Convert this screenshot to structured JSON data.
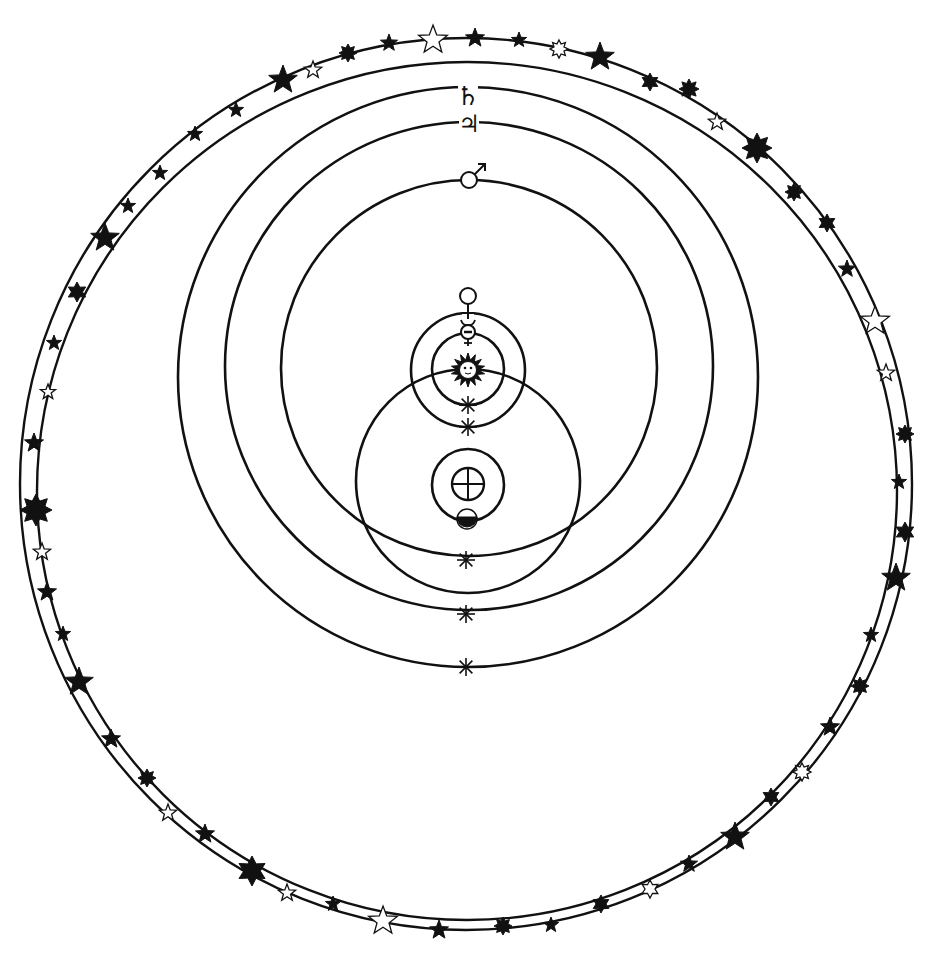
{
  "colors": {
    "ink": "#111111",
    "paper": "#ffffff"
  },
  "sphere_of_fixed_stars": {
    "label": "Sphere of fixed stars",
    "outer": {
      "cx": 466,
      "cy": 484,
      "rx": 446,
      "ry": 446
    },
    "inner": {
      "cx": 467,
      "cy": 491,
      "rx": 430,
      "ry": 429
    }
  },
  "orbits": [
    {
      "name": "saturn-orbit",
      "label": "Saturn",
      "symbol": "♄",
      "cx": 468,
      "cy": 377,
      "r": 290,
      "symbol_y": 96
    },
    {
      "name": "jupiter-orbit",
      "label": "Jupiter",
      "symbol": "♃",
      "cx": 469,
      "cy": 366,
      "r": 244,
      "symbol_y": 124
    },
    {
      "name": "mars-orbit",
      "label": "Mars",
      "symbol": "♂",
      "cx": 469,
      "cy": 368,
      "r": 188,
      "symbol_y": 180
    },
    {
      "name": "sun-orbit",
      "label": "Sun's orbit around Earth",
      "cx": 468,
      "cy": 481,
      "r": 112
    },
    {
      "name": "venus-orbit",
      "label": "Venus",
      "symbol": "♀",
      "cx": 468,
      "cy": 370,
      "r": 57
    },
    {
      "name": "mercury-orbit",
      "label": "Mercury",
      "symbol": "☿",
      "cx": 468,
      "cy": 369,
      "r": 36
    },
    {
      "name": "moon-orbit",
      "label": "Moon's orbit",
      "cx": 468,
      "cy": 485,
      "r": 36
    }
  ],
  "bodies": {
    "earth": {
      "label": "Earth",
      "symbol": "⊕",
      "cx": 468,
      "cy": 484,
      "r": 16
    },
    "moon": {
      "label": "Moon",
      "cx": 467,
      "cy": 519,
      "r": 10
    },
    "sun": {
      "label": "Sun",
      "cx": 468,
      "cy": 370,
      "r": 17
    }
  },
  "asterisks": [
    {
      "x": 468,
      "y": 405
    },
    {
      "x": 468,
      "y": 427
    },
    {
      "x": 466,
      "y": 560
    },
    {
      "x": 466,
      "y": 614
    },
    {
      "x": 466,
      "y": 667
    }
  ],
  "stars": [
    {
      "x": 283,
      "y": 80,
      "r": 15,
      "points": 5,
      "filled": true
    },
    {
      "x": 313,
      "y": 70,
      "r": 9,
      "points": 5,
      "filled": false
    },
    {
      "x": 348,
      "y": 53,
      "r": 9,
      "points": 8,
      "filled": true
    },
    {
      "x": 389,
      "y": 43,
      "r": 9,
      "points": 5,
      "filled": true
    },
    {
      "x": 433,
      "y": 40,
      "r": 15,
      "points": 5,
      "filled": false
    },
    {
      "x": 475,
      "y": 38,
      "r": 10,
      "points": 5,
      "filled": true
    },
    {
      "x": 519,
      "y": 40,
      "r": 8,
      "points": 5,
      "filled": true
    },
    {
      "x": 559,
      "y": 49,
      "r": 9,
      "points": 8,
      "filled": false
    },
    {
      "x": 600,
      "y": 57,
      "r": 15,
      "points": 5,
      "filled": true
    },
    {
      "x": 650,
      "y": 82,
      "r": 9,
      "points": 6,
      "filled": true
    },
    {
      "x": 689,
      "y": 89,
      "r": 10,
      "points": 8,
      "filled": true
    },
    {
      "x": 717,
      "y": 122,
      "r": 9,
      "points": 5,
      "filled": false
    },
    {
      "x": 757,
      "y": 148,
      "r": 15,
      "points": 8,
      "filled": true
    },
    {
      "x": 794,
      "y": 192,
      "r": 9,
      "points": 8,
      "filled": true
    },
    {
      "x": 827,
      "y": 223,
      "r": 9,
      "points": 6,
      "filled": true
    },
    {
      "x": 847,
      "y": 269,
      "r": 9,
      "points": 5,
      "filled": true
    },
    {
      "x": 875,
      "y": 321,
      "r": 15,
      "points": 5,
      "filled": false
    },
    {
      "x": 886,
      "y": 373,
      "r": 9,
      "points": 5,
      "filled": false
    },
    {
      "x": 905,
      "y": 434,
      "r": 9,
      "points": 8,
      "filled": true
    },
    {
      "x": 899,
      "y": 482,
      "r": 8,
      "points": 5,
      "filled": true
    },
    {
      "x": 905,
      "y": 532,
      "r": 10,
      "points": 6,
      "filled": true
    },
    {
      "x": 896,
      "y": 578,
      "r": 15,
      "points": 5,
      "filled": true
    },
    {
      "x": 871,
      "y": 635,
      "r": 8,
      "points": 5,
      "filled": true
    },
    {
      "x": 860,
      "y": 686,
      "r": 9,
      "points": 8,
      "filled": true
    },
    {
      "x": 830,
      "y": 727,
      "r": 10,
      "points": 5,
      "filled": true
    },
    {
      "x": 802,
      "y": 772,
      "r": 9,
      "points": 8,
      "filled": false
    },
    {
      "x": 771,
      "y": 797,
      "r": 9,
      "points": 6,
      "filled": true
    },
    {
      "x": 735,
      "y": 837,
      "r": 15,
      "points": 5,
      "filled": true
    },
    {
      "x": 689,
      "y": 864,
      "r": 9,
      "points": 5,
      "filled": true
    },
    {
      "x": 650,
      "y": 889,
      "r": 9,
      "points": 6,
      "filled": false
    },
    {
      "x": 601,
      "y": 904,
      "r": 9,
      "points": 6,
      "filled": true
    },
    {
      "x": 551,
      "y": 925,
      "r": 8,
      "points": 5,
      "filled": true
    },
    {
      "x": 503,
      "y": 926,
      "r": 9,
      "points": 8,
      "filled": true
    },
    {
      "x": 439,
      "y": 930,
      "r": 10,
      "points": 5,
      "filled": true
    },
    {
      "x": 383,
      "y": 921,
      "r": 15,
      "points": 5,
      "filled": false
    },
    {
      "x": 333,
      "y": 904,
      "r": 8,
      "points": 5,
      "filled": true
    },
    {
      "x": 287,
      "y": 893,
      "r": 9,
      "points": 5,
      "filled": false
    },
    {
      "x": 252,
      "y": 871,
      "r": 15,
      "points": 6,
      "filled": true
    },
    {
      "x": 205,
      "y": 834,
      "r": 10,
      "points": 5,
      "filled": true
    },
    {
      "x": 168,
      "y": 813,
      "r": 9,
      "points": 5,
      "filled": false
    },
    {
      "x": 147,
      "y": 778,
      "r": 9,
      "points": 8,
      "filled": true
    },
    {
      "x": 111,
      "y": 739,
      "r": 10,
      "points": 5,
      "filled": true
    },
    {
      "x": 79,
      "y": 682,
      "r": 15,
      "points": 5,
      "filled": true
    },
    {
      "x": 63,
      "y": 634,
      "r": 8,
      "points": 5,
      "filled": true
    },
    {
      "x": 47,
      "y": 592,
      "r": 10,
      "points": 5,
      "filled": true
    },
    {
      "x": 42,
      "y": 552,
      "r": 9,
      "points": 5,
      "filled": false
    },
    {
      "x": 36,
      "y": 510,
      "r": 16,
      "points": 8,
      "filled": true
    },
    {
      "x": 34,
      "y": 443,
      "r": 10,
      "points": 5,
      "filled": true
    },
    {
      "x": 48,
      "y": 392,
      "r": 8,
      "points": 5,
      "filled": false
    },
    {
      "x": 54,
      "y": 343,
      "r": 8,
      "points": 5,
      "filled": true
    },
    {
      "x": 77,
      "y": 292,
      "r": 10,
      "points": 6,
      "filled": true
    },
    {
      "x": 105,
      "y": 238,
      "r": 15,
      "points": 5,
      "filled": true
    },
    {
      "x": 128,
      "y": 206,
      "r": 8,
      "points": 5,
      "filled": true
    },
    {
      "x": 160,
      "y": 173,
      "r": 8,
      "points": 5,
      "filled": true
    },
    {
      "x": 195,
      "y": 134,
      "r": 8,
      "points": 5,
      "filled": true
    },
    {
      "x": 236,
      "y": 110,
      "r": 8,
      "points": 5,
      "filled": true
    }
  ]
}
